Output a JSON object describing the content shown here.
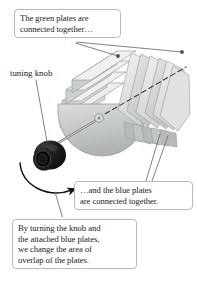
{
  "figure": {
    "background_color": "#ffffff",
    "line_color": "#444444",
    "callout_border_color": "#b9b9b9",
    "plate_fill_light": "#e9ebea",
    "plate_fill_mid": "#d2d6d5",
    "plate_fill_dark": "#b3b8b7",
    "knob_color": "#141414"
  },
  "callouts": {
    "green_plates": {
      "line1": "The green plates are",
      "line2": "connected together…"
    },
    "blue_plates": {
      "line1": "…and the blue plates",
      "line2": "are connected together."
    },
    "turning": {
      "line1": "By turning the knob and",
      "line2": "the attached blue plates,",
      "line3": "we change the area of",
      "line4": "overlap of the plates."
    }
  },
  "labels": {
    "tuning_knob": "tuning knob"
  },
  "icons": {
    "rotation_arrow": "curved-rotation-arrow",
    "leader_dot": "leader-line-dot",
    "axis": "dashed-rotation-axis"
  }
}
